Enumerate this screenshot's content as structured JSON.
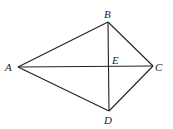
{
  "diagram": {
    "points": {
      "A": {
        "label": "A",
        "x": 18,
        "y": 67
      },
      "B": {
        "label": "B",
        "x": 108,
        "y": 22
      },
      "C": {
        "label": "C",
        "x": 153,
        "y": 66
      },
      "D": {
        "label": "D",
        "x": 109,
        "y": 111
      },
      "E": {
        "label": "E",
        "x": 109,
        "y": 66
      }
    },
    "segments": [
      "AB",
      "BC",
      "CD",
      "DA",
      "AC",
      "BD"
    ]
  }
}
